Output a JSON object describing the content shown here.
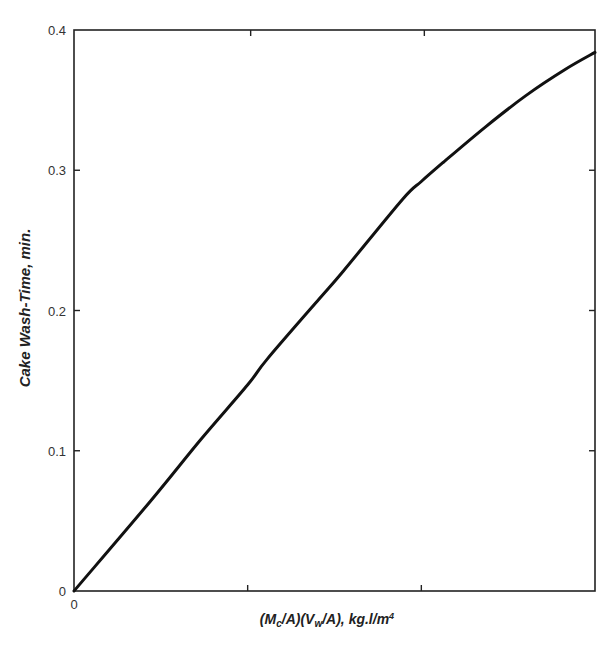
{
  "chart_data": {
    "type": "line",
    "title": "",
    "xlabel": "(Mc/A)(Vw/A), kg.l/m4",
    "xlabel_parts": {
      "open1": "(M",
      "sub1": "c",
      "mid1": "/A)(V",
      "sub2": "w",
      "mid2": "/A), kg.l/m",
      "sup": "4"
    },
    "ylabel": "Cake Wash-Time,  min.",
    "xlim": [
      0,
      3
    ],
    "ylim": [
      0,
      0.4
    ],
    "x_tick_labels": [
      "0"
    ],
    "x_tick_positions": [
      0,
      1,
      2,
      3
    ],
    "y_tick_labels": [
      "0",
      "0.1",
      "0.2",
      "0.3",
      "0.4"
    ],
    "y_tick_values": [
      0,
      0.1,
      0.2,
      0.3,
      0.4
    ],
    "grid": false,
    "legend": null,
    "series": [
      {
        "name": "Cake wash-time",
        "x": [
          0,
          0.44,
          0.73,
          1.0,
          1.11,
          1.41,
          1.55,
          1.89,
          2.0,
          2.13,
          2.37,
          2.6,
          2.83,
          3.0
        ],
        "y": [
          0,
          0.064,
          0.108,
          0.147,
          0.165,
          0.208,
          0.228,
          0.279,
          0.292,
          0.306,
          0.331,
          0.353,
          0.372,
          0.384
        ]
      }
    ]
  }
}
